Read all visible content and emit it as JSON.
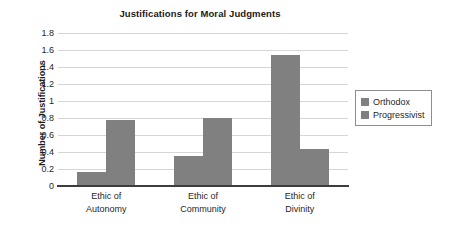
{
  "chart_data": {
    "type": "bar",
    "title": "Justifications for Moral Judgments",
    "xlabel": "",
    "ylabel": "Number of Justifications",
    "categories": [
      "Ethic of Autonomy",
      "Ethic of Community",
      "Ethic of Divinity"
    ],
    "category_lines": [
      [
        "Ethic of",
        "Autonomy"
      ],
      [
        "Ethic of",
        "Community"
      ],
      [
        "Ethic of",
        "Divinity"
      ]
    ],
    "series": [
      {
        "name": "Orthodox",
        "values": [
          0.17,
          0.35,
          1.54
        ],
        "color": "#808080"
      },
      {
        "name": "Progressivist",
        "values": [
          0.78,
          0.8,
          0.43
        ],
        "color": "#808080"
      }
    ],
    "ylim": [
      0,
      1.8
    ],
    "ytick_step": 0.2,
    "ytick_labels": [
      "1.8",
      "1.6",
      "1.4",
      "1.2",
      "1",
      "0.8",
      "0.6",
      "0.4",
      "0.2",
      "0"
    ],
    "ytick_values": [
      1.8,
      1.6,
      1.4,
      1.2,
      1.0,
      0.8,
      0.6,
      0.4,
      0.2,
      0
    ],
    "grid": "horizontal",
    "legend_position": "right",
    "axis_color": "#3d3d3d",
    "grid_color": "#d6d6d6",
    "background": "#ffffff"
  },
  "legend": {
    "entries": [
      {
        "label": "Orthodox",
        "color": "#808080"
      },
      {
        "label": "Progressivist",
        "color": "#808080"
      }
    ]
  }
}
